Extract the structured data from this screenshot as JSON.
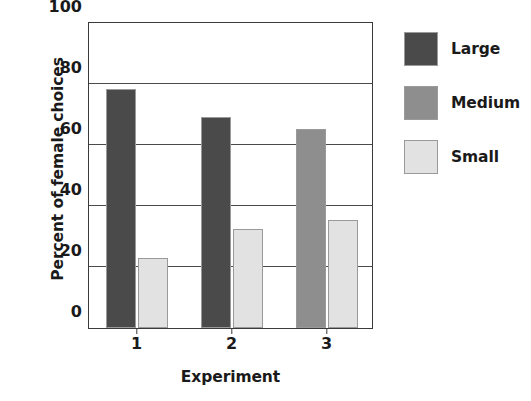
{
  "chart_data": {
    "type": "bar",
    "title": "",
    "xlabel": "Experiment",
    "ylabel": "Percent of female choices",
    "categories": [
      "1",
      "2",
      "3"
    ],
    "ylim": [
      0,
      100
    ],
    "yticks": [
      0,
      20,
      40,
      60,
      80,
      100
    ],
    "ytick_labels": [
      "0",
      "20",
      "40",
      "60",
      "80",
      "100"
    ],
    "grid": true,
    "legend_position": "right",
    "series": [
      {
        "name": "Large",
        "color": "#4a4a4a",
        "values": [
          78.4,
          69.3,
          null
        ]
      },
      {
        "name": "Medium",
        "color": "#8e8e8e",
        "values": [
          null,
          null,
          65.3
        ]
      },
      {
        "name": "Small",
        "color": "#e2e2e2",
        "values": [
          23.0,
          32.4,
          35.5
        ]
      }
    ],
    "bars": [
      {
        "category": "1",
        "series": "Large",
        "value": 78.4,
        "color": "#4a4a4a"
      },
      {
        "category": "1",
        "series": "Small",
        "value": 23.0,
        "color": "#e2e2e2"
      },
      {
        "category": "2",
        "series": "Large",
        "value": 69.3,
        "color": "#4a4a4a"
      },
      {
        "category": "2",
        "series": "Small",
        "value": 32.4,
        "color": "#e2e2e2"
      },
      {
        "category": "3",
        "series": "Medium",
        "value": 65.3,
        "color": "#8e8e8e"
      },
      {
        "category": "3",
        "series": "Small",
        "value": 35.5,
        "color": "#e2e2e2"
      }
    ]
  },
  "legend": {
    "items": [
      {
        "label": "Large",
        "color": "#4a4a4a"
      },
      {
        "label": "Medium",
        "color": "#8e8e8e"
      },
      {
        "label": "Small",
        "color": "#e2e2e2"
      }
    ]
  },
  "axes": {
    "frame_color": "#3a3a3a",
    "grid_color": "#4a4a4a"
  }
}
